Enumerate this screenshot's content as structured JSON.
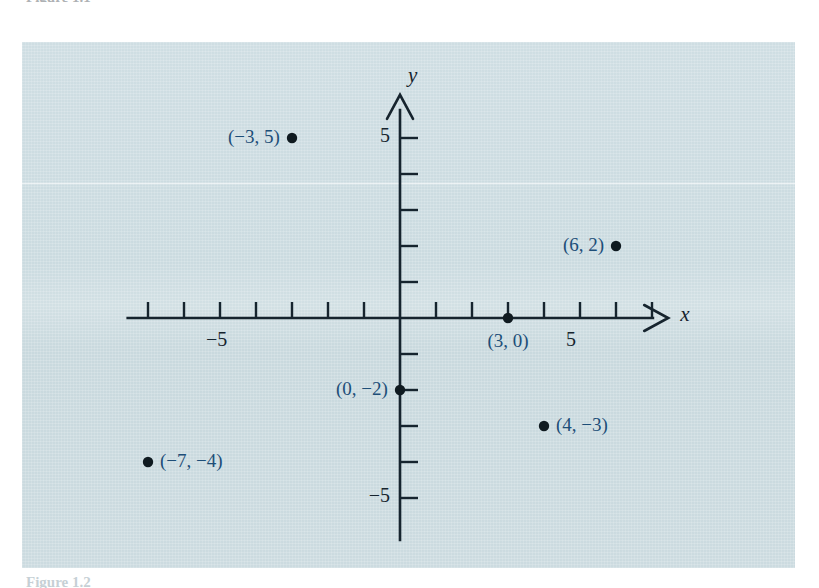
{
  "page": {
    "background": "#ffffff",
    "panel_color": "#ccdce1",
    "caption_top": "Figure 1.1",
    "caption_bottom": "Figure 1.2"
  },
  "colors": {
    "axis": "#16242e",
    "point": "#0f1a20",
    "point_label": "#1d4e78",
    "panel": "#ccdce1"
  },
  "chart_data": {
    "type": "scatter",
    "title": "",
    "xlabel": "x",
    "ylabel": "y",
    "grid": false,
    "legend": null,
    "xlim": [
      -8,
      8
    ],
    "ylim": [
      -6.5,
      6.5
    ],
    "x_tick_interval": 1,
    "y_tick_interval": 1,
    "x_tick_labels": [
      {
        "value": -5,
        "text": "−5"
      },
      {
        "value": 5,
        "text": "5"
      }
    ],
    "y_tick_labels": [
      {
        "value": 5,
        "text": "5"
      },
      {
        "value": -5,
        "text": "−5"
      }
    ],
    "points": [
      {
        "x": -3,
        "y": 5,
        "label": "(−3, 5)",
        "label_side": "left"
      },
      {
        "x": 6,
        "y": 2,
        "label": "(6, 2)",
        "label_side": "left"
      },
      {
        "x": 3,
        "y": 0,
        "label": "(3, 0)",
        "label_side": "below"
      },
      {
        "x": 0,
        "y": -2,
        "label": "(0, −2)",
        "label_side": "left"
      },
      {
        "x": 4,
        "y": -3,
        "label": "(4, −3)",
        "label_side": "right"
      },
      {
        "x": -7,
        "y": -4,
        "label": "(−7, −4)",
        "label_side": "right"
      }
    ]
  }
}
